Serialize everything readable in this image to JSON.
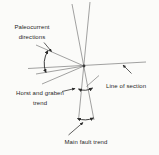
{
  "labels": {
    "paleocurrent_line1": "Paleocurrent",
    "paleocurrent_line2": "directions",
    "line_of_section": "Line of section",
    "horst_graben_line1": "Horst and graben",
    "horst_graben_line2": "trend",
    "main_fault": "Main fault trend"
  },
  "colors": {
    "background": "#fbfbf9",
    "thin_line": "#7a7a7a",
    "annotation_ink": "#2b2b2b",
    "text": "#262626"
  },
  "diagram": {
    "center": [
      84,
      66
    ],
    "lines": [
      {
        "name": "main-fault-line-a",
        "from": [
          72,
          4
        ],
        "to": [
          94,
          120
        ]
      },
      {
        "name": "main-fault-line-b",
        "from": [
          90,
          2
        ],
        "to": [
          78.5,
          120
        ]
      },
      {
        "name": "line-of-section-line",
        "from": [
          28,
          68.5
        ],
        "to": [
          146,
          62
        ]
      },
      {
        "name": "paleocurrent-line-upper",
        "from": [
          84,
          66
        ],
        "to": [
          36,
          45
        ]
      },
      {
        "name": "paleocurrent-line-middle",
        "from": [
          84,
          66
        ],
        "to": [
          36,
          74
        ]
      },
      {
        "name": "paleocurrent-line-lower",
        "from": [
          84,
          66
        ],
        "to": [
          42,
          84
        ]
      },
      {
        "name": "short-trend-line",
        "from": [
          86.5,
          86.5
        ],
        "to": [
          99,
          75.5
        ]
      }
    ],
    "range_arrows": [
      {
        "name": "paleocurrent-range-arrow",
        "d": "M 48,50.5 Q 41.5,61.5 46,72.5"
      },
      {
        "name": "horst-graben-range-arrow",
        "d": "M 78.5,89 Q 85.5,92 92.5,88"
      },
      {
        "name": "main-fault-range-arrow",
        "d": "M 77.5,118.5 Q 85.5,121.5 93.5,118"
      }
    ],
    "pointers": [
      {
        "name": "paleocurrent-pointer-arrow",
        "from": [
          44,
          42.5
        ],
        "to": [
          51.5,
          51.5
        ]
      },
      {
        "name": "line-of-section-pointer-arrow",
        "from": [
          131.5,
          73.5
        ],
        "to": [
          123,
          65
        ]
      },
      {
        "name": "horst-graben-pointer-arrow",
        "from": [
          62,
          91.5
        ],
        "to": [
          75,
          88.5
        ]
      },
      {
        "name": "main-fault-pointer-arrow",
        "from": [
          68.5,
          135
        ],
        "to": [
          83,
          122.5
        ]
      }
    ]
  }
}
